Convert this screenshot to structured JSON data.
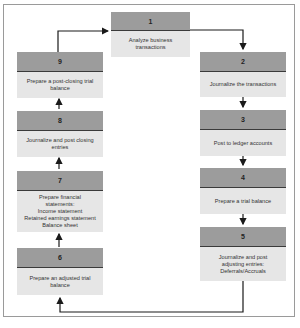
{
  "diagram": {
    "steps": [
      {
        "number": "1",
        "text": "Analyze business transactions"
      },
      {
        "number": "2",
        "text": "Journalize the transactions"
      },
      {
        "number": "3",
        "text": "Post to ledger accounts"
      },
      {
        "number": "4",
        "text": "Prepare a trial balance"
      },
      {
        "number": "5",
        "text_lines": [
          "Journalize and post",
          "adjusting entries:",
          "Deferrals/Accruals"
        ]
      },
      {
        "number": "6",
        "text": "Prepare an adjusted trial balance"
      },
      {
        "number": "7",
        "text_lines": [
          "Prepare financial",
          "statements:",
          "Income statement",
          "Retained earnings statement",
          "Balance sheet"
        ]
      },
      {
        "number": "8",
        "text": "Journalize and post closing entries"
      },
      {
        "number": "9",
        "text": "Prepare a post-closing trial balance"
      }
    ],
    "flow": [
      "1→2",
      "2→3",
      "3→4",
      "4→5",
      "5→6",
      "6→7",
      "7→8",
      "8→9",
      "9→1"
    ],
    "colors": {
      "header": "#9c9c9c",
      "body": "#e6e6e6",
      "divider": "#3a3a3a",
      "arrow": "#1a1a1a",
      "frame": "#9a9a9a"
    }
  }
}
